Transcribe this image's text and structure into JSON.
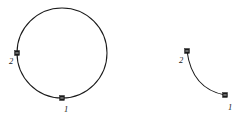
{
  "figure": {
    "background_color": "#ffffff",
    "stroke_color": "#1a1a1a",
    "marker_color": "#1a1a1a",
    "canvas": {
      "width": 245,
      "height": 121
    },
    "shapes": [
      {
        "id": "circle-curve",
        "name": "closed circular curve",
        "type": "circle",
        "center_x": 62,
        "center_y": 53,
        "radius": 45,
        "stroke_width": 1.05
      },
      {
        "id": "arc-curve",
        "name": "open concave arc",
        "type": "arc",
        "start_x": 187,
        "start_y": 51,
        "end_x": 225,
        "end_y": 95,
        "control_x": 192,
        "control_y": 89,
        "stroke_width": 1.05
      }
    ],
    "markers": [
      {
        "id": "circle-point-2",
        "name": "point marker 2 on circle",
        "shape_id": "circle-curve",
        "x": 17,
        "y": 53,
        "size": 5,
        "label": "2",
        "label_x": 9,
        "label_y": 64
      },
      {
        "id": "circle-point-1",
        "name": "point marker 1 on circle",
        "shape_id": "circle-curve",
        "x": 62,
        "y": 98,
        "size": 5,
        "label": "1",
        "label_x": 64,
        "label_y": 112
      },
      {
        "id": "arc-point-2",
        "name": "point marker 2 on arc",
        "shape_id": "arc-curve",
        "x": 187,
        "y": 51,
        "size": 5,
        "label": "2",
        "label_x": 179,
        "label_y": 63
      },
      {
        "id": "arc-point-1",
        "name": "point marker 1 on arc",
        "shape_id": "arc-curve",
        "x": 225,
        "y": 95,
        "size": 5,
        "label": "1",
        "label_x": 228,
        "label_y": 110
      }
    ]
  }
}
